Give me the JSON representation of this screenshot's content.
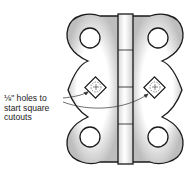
{
  "diagram": {
    "callout": {
      "lines": [
        "⅛\" holes to",
        "start square",
        "cutouts"
      ]
    },
    "colors": {
      "outline": "#1a1a1a",
      "fill_light": "#ffffff",
      "fill_shade": "#c8c8c8",
      "background": "#ffffff"
    },
    "parts": [
      "left leaf",
      "right leaf",
      "center knuckle",
      "4 screw holes",
      "2 square cutouts with pilot holes"
    ]
  }
}
